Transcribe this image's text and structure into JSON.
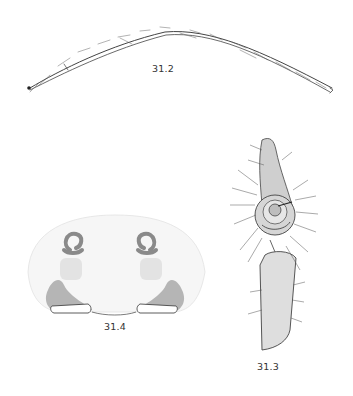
{
  "plate": {
    "figures": [
      {
        "id": "fig-31-2",
        "label": "31.2",
        "subject": "leg"
      },
      {
        "id": "fig-31-3",
        "label": "31.3",
        "subject": "male-palp"
      },
      {
        "id": "fig-31-4",
        "label": "31.4",
        "subject": "epigyne"
      }
    ],
    "colors": {
      "background": "#ffffff",
      "ink": "#333333",
      "shade": "#8a8a8a"
    }
  }
}
